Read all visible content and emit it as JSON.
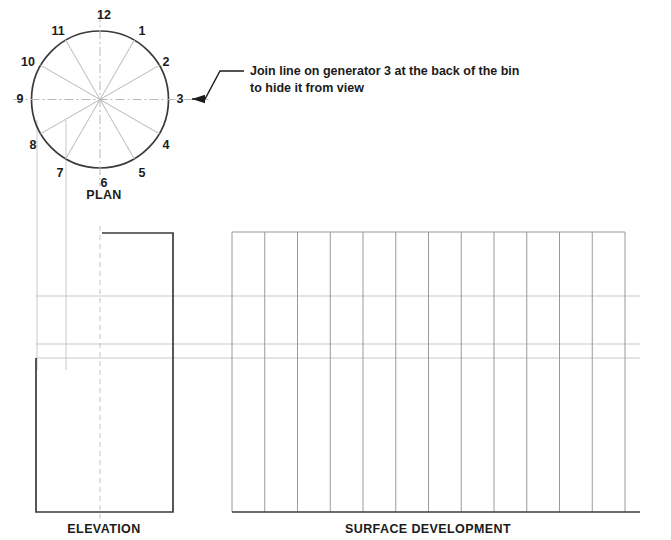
{
  "drawing": {
    "background_color": "#ffffff",
    "outline_color": "#3a3a3a",
    "construction_color": "#c9c9c9",
    "centerline_color": "#b9b9b9",
    "text_color": "#1b1b1b",
    "canvas": {
      "width": 671,
      "height": 540
    }
  },
  "plan": {
    "label": "PLAN",
    "label_x": 104,
    "label_y": 199,
    "circle": {
      "cx": 100,
      "cy": 99.5,
      "r": 68.5
    },
    "generator_count": 12,
    "generators": [
      {
        "number": "1",
        "angle_deg": -60,
        "label_x": 142,
        "label_y": 35
      },
      {
        "number": "2",
        "angle_deg": -30,
        "label_x": 166,
        "label_y": 66
      },
      {
        "number": "3",
        "angle_deg": 0,
        "label_x": 180,
        "label_y": 103
      },
      {
        "number": "4",
        "angle_deg": 30,
        "label_x": 166,
        "label_y": 149
      },
      {
        "number": "5",
        "angle_deg": 60,
        "label_x": 142,
        "label_y": 177
      },
      {
        "number": "6",
        "angle_deg": 90,
        "label_x": 104,
        "label_y": 187
      },
      {
        "number": "7",
        "angle_deg": 120,
        "label_x": 60,
        "label_y": 177
      },
      {
        "number": "8",
        "angle_deg": 150,
        "label_x": 33,
        "label_y": 149
      },
      {
        "number": "9",
        "angle_deg": 180,
        "label_x": 20,
        "label_y": 103
      },
      {
        "number": "10",
        "angle_deg": -150,
        "label_x": 28,
        "label_y": 66
      },
      {
        "number": "11",
        "angle_deg": -120,
        "label_x": 58,
        "label_y": 35
      },
      {
        "number": "12",
        "angle_deg": -90,
        "label_x": 104,
        "label_y": 19
      }
    ]
  },
  "annotation": {
    "line1": "Join line on generator 3 at the back of the bin",
    "line2": "to hide it from view",
    "text_x": 250,
    "line1_y": 75,
    "line2_y": 92,
    "leader": {
      "x1": 244,
      "y1": 71,
      "x2": 220,
      "y2": 71,
      "x3": 205,
      "y3": 99,
      "x4": 192,
      "y4": 99
    },
    "arrow_tip_x": 192,
    "arrow_y": 99
  },
  "elevation": {
    "label": "ELEVATION",
    "label_x": 104,
    "label_y": 533,
    "outline_points": "36,358 36,512 173,512 173,233 102,233",
    "left_x": 36,
    "right_x": 173,
    "bottom_y": 512,
    "top_y": 233,
    "slant_start_y": 358,
    "apex_x": 102,
    "centerline_x": 100,
    "centerline_top_y": 226,
    "centerline_bottom_y": 519
  },
  "development": {
    "label": "SURFACE DEVELOPMENT",
    "label_x": 428,
    "label_y": 533,
    "left_x": 232,
    "right_x": 625,
    "top_y": 232,
    "bottom_y": 512,
    "column_count": 12,
    "division_count": 13
  },
  "projection_lines": {
    "horizontal_y": [
      296,
      344,
      358
    ],
    "horizontal_x_start": 36,
    "horizontal_x_end": 640,
    "vertical_from_plan_x": [
      37,
      66
    ],
    "vertical_top_y": 120,
    "vertical_bottom_y": 370
  }
}
